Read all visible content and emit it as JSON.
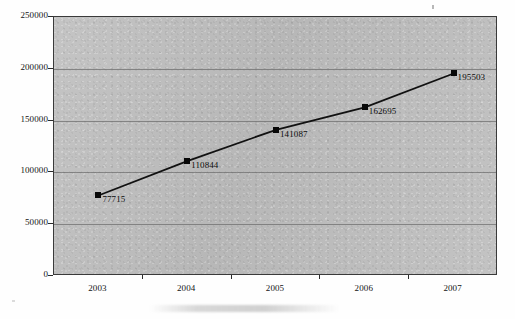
{
  "chart_data": {
    "type": "line",
    "title": "",
    "xlabel": "",
    "ylabel": "",
    "categories": [
      "2003",
      "2004",
      "2005",
      "2006",
      "2007"
    ],
    "values": [
      77715,
      110844,
      141087,
      162695,
      195503
    ],
    "point_labels": [
      "77715",
      "110844",
      "141087",
      "162695",
      "195503"
    ],
    "ylim": [
      0,
      250000
    ],
    "ytick_labels": [
      "0",
      "50000",
      "100000",
      "150000",
      "200000",
      "250000"
    ],
    "ytick_values": [
      0,
      50000,
      100000,
      150000,
      200000,
      250000
    ],
    "grid": true,
    "legend": "none",
    "series": [
      {
        "name": "",
        "values": [
          77715,
          110844,
          141087,
          162695,
          195503
        ],
        "marker": "square",
        "marker_color": "#080808",
        "line_color": "#111111"
      }
    ],
    "plot_background_color": "#bebebe",
    "gridline_color": "#6f6f6f",
    "axis_color": "#2b2b2b"
  }
}
